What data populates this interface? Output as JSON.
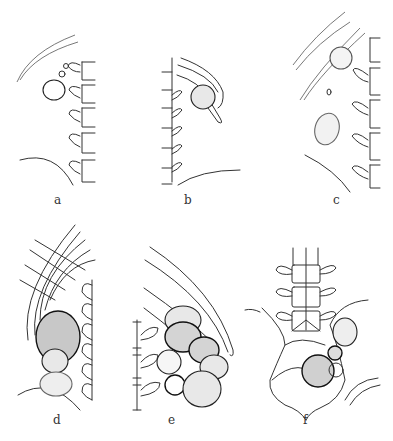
{
  "figure": {
    "panels": [
      {
        "id": "a",
        "label": "a",
        "description": "Lateral view: single round mass near upper vertebrae below rib arcs"
      },
      {
        "id": "b",
        "label": "b",
        "description": "Lateral view: round mass between rib arcs adjacent to spine"
      },
      {
        "id": "c",
        "label": "c",
        "description": "Lateral view: two masses, one at rib margin and one lower oval mass"
      },
      {
        "id": "d",
        "label": "d",
        "description": "Lateral view: stacked cluster of shaded masses beneath crossed rib lines"
      },
      {
        "id": "e",
        "label": "e",
        "description": "Lateral view: multiple overlapping shaded masses along spine under rib arc"
      },
      {
        "id": "f",
        "label": "f",
        "description": "Frontal view: lumbar spine and pelvis with several round masses"
      }
    ]
  }
}
